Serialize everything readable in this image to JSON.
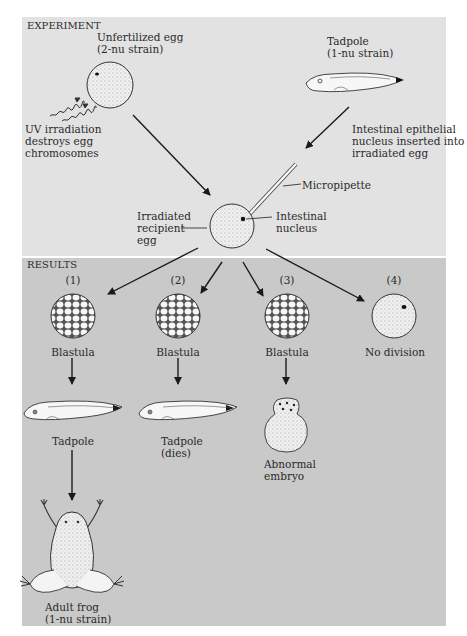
{
  "experiment": {
    "header": "EXPERIMENT",
    "unfertilized_egg": {
      "line1": "Unfertilized egg",
      "line2": "(2-nu strain)"
    },
    "uv": {
      "line1": "UV irradiation",
      "line2": "destroys egg",
      "line3": "chromosomes"
    },
    "tadpole_donor": {
      "line1": "Tadpole",
      "line2": "(1-nu strain)"
    },
    "nucleus_insert": {
      "line1": "Intestinal epithelial",
      "line2": "nucleus inserted into",
      "line3": "irradiated egg"
    },
    "micropipette": "Micropipette",
    "recipient": {
      "line1": "Irradiated",
      "line2": "recipient",
      "line3": "egg"
    },
    "nucleus": {
      "line1": "Intestinal",
      "line2": "nucleus"
    }
  },
  "results": {
    "header": "RESULTS",
    "outcomes": [
      {
        "number": "(1)",
        "stage1": "Blastula",
        "stage2": "Tadpole",
        "stage3_line1": "Adult frog",
        "stage3_line2": "(1-nu strain)"
      },
      {
        "number": "(2)",
        "stage1": "Blastula",
        "stage2_line1": "Tadpole",
        "stage2_line2": "(dies)"
      },
      {
        "number": "(3)",
        "stage1": "Blastula",
        "stage2_line1": "Abnormal",
        "stage2_line2": "embryo"
      },
      {
        "number": "(4)",
        "stage1": "No division"
      }
    ]
  },
  "colors": {
    "experiment_bg": "#e2e2e2",
    "results_bg": "#c9c9c9",
    "line": "#1a1a1a",
    "cell_fill": "#f4f4f4"
  }
}
